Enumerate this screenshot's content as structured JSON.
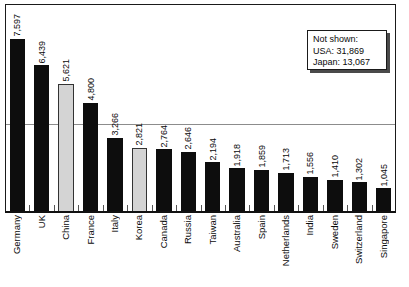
{
  "chart_data": {
    "type": "bar",
    "title": "",
    "subtitle": "",
    "xlabel": "",
    "ylabel": "",
    "ylim": [
      0,
      8200
    ],
    "grid": true,
    "gridlines": [
      4000
    ],
    "legend_position": "none",
    "categories": [
      "Germany",
      "UK",
      "China",
      "France",
      "Italy",
      "Korea",
      "Canada",
      "Russia",
      "Taiwan",
      "Australia",
      "Spain",
      "Netherlands",
      "India",
      "Sweden",
      "Switzerland",
      "Singapore"
    ],
    "values": [
      7597,
      6439,
      5621,
      4800,
      3266,
      2821,
      2764,
      2646,
      2194,
      1918,
      1859,
      1713,
      1556,
      1410,
      1302,
      1045
    ],
    "value_labels": [
      "7,597",
      "6,439",
      "5,621",
      "4,800",
      "3,266",
      "2,821",
      "2,764",
      "2,646",
      "2,194",
      "1,918",
      "1,859",
      "1,713",
      "1,556",
      "1,410",
      "1,302",
      "1,045"
    ],
    "bar_styles": [
      "dark",
      "dark",
      "light",
      "dark",
      "dark",
      "light",
      "dark",
      "dark",
      "dark",
      "dark",
      "dark",
      "dark",
      "dark",
      "dark",
      "dark",
      "dark"
    ],
    "colors": {
      "bar_dark": "#0d0d0d",
      "bar_light": "#d4d4d4",
      "bar_light_outline": "#333333",
      "axis": "#111111",
      "gridline": "#8c8c8c",
      "text": "#0a0a0a",
      "background": "#ffffff"
    }
  },
  "annotation": {
    "heading": "Not shown:",
    "lines": [
      "USA: 31,869",
      "Japan: 13,067"
    ],
    "entries": [
      {
        "label": "USA",
        "value": 31869,
        "text": "USA: 31,869"
      },
      {
        "label": "Japan",
        "value": 13067,
        "text": "Japan: 13,067"
      }
    ]
  }
}
